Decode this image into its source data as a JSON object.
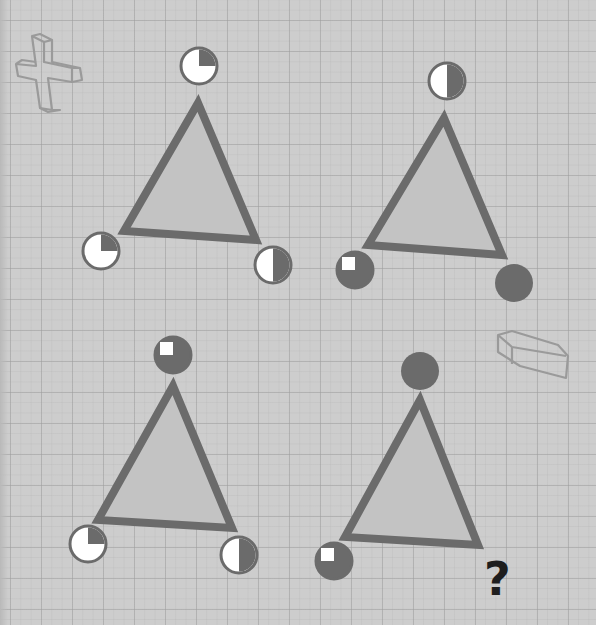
{
  "puzzle": {
    "colors": {
      "paper": "#cdcdcd",
      "triangle_stroke": "#6b6b6b",
      "triangle_fill": "#c3c3c3",
      "dark": "#6b6b6b",
      "light": "#ffffff",
      "question_mark": "#1e1e1e",
      "doodle": "#9a9a9a"
    },
    "triangles": [
      {
        "id": "top-left",
        "circles": [
          {
            "position": "top",
            "dark_fraction": "1/4"
          },
          {
            "position": "bottom-left",
            "dark_fraction": "1/4"
          },
          {
            "position": "bottom-right",
            "dark_fraction": "1/2"
          }
        ]
      },
      {
        "id": "top-right",
        "circles": [
          {
            "position": "top",
            "dark_fraction": "1/2"
          },
          {
            "position": "bottom-left",
            "dark_fraction": "3/4"
          },
          {
            "position": "bottom-right",
            "dark_fraction": "1"
          }
        ]
      },
      {
        "id": "bottom-left",
        "circles": [
          {
            "position": "top",
            "dark_fraction": "3/4"
          },
          {
            "position": "bottom-left",
            "dark_fraction": "1/4"
          },
          {
            "position": "bottom-right",
            "dark_fraction": "1/2"
          }
        ]
      },
      {
        "id": "bottom-right",
        "circles": [
          {
            "position": "top",
            "dark_fraction": "1"
          },
          {
            "position": "bottom-left",
            "dark_fraction": "3/4"
          },
          {
            "position": "bottom-right",
            "dark_fraction": "?"
          }
        ]
      }
    ],
    "question_mark": "?",
    "decorations": [
      "plus-sign-doodle",
      "minus-sign-doodle"
    ]
  }
}
